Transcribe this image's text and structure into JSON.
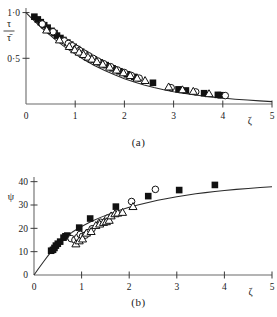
{
  "figure": {
    "panels": [
      {
        "id": "a",
        "caption": "(a)",
        "ylabel_num": "τ",
        "ylabel_den": "τ̄",
        "xlabel": "ζ"
      },
      {
        "id": "b",
        "caption": "(b)",
        "ylabel": "ψ",
        "xlabel": "ζ"
      }
    ]
  },
  "chart_data": [
    {
      "type": "scatter",
      "panel": "a",
      "title": "",
      "xlabel": "ζ",
      "ylabel": "τ/τ̄",
      "xlim": [
        0,
        5
      ],
      "ylim": [
        0,
        1.05
      ],
      "grid": false,
      "legend": "none",
      "xticks": [
        0,
        1,
        2,
        3,
        4,
        5
      ],
      "xticklabels": [
        "0",
        "1",
        "2",
        "3",
        "4",
        "5"
      ],
      "yticks": [
        0.5,
        1.0
      ],
      "yticklabels": [
        "0·5",
        "1·0"
      ],
      "curve": {
        "name": "theoretical curve",
        "x": [
          0.0,
          0.1,
          0.2,
          0.3,
          0.4,
          0.5,
          0.6,
          0.7,
          0.8,
          0.9,
          1.0,
          1.2,
          1.4,
          1.6,
          1.8,
          2.0,
          2.2,
          2.4,
          2.6,
          2.8,
          3.0,
          3.2,
          3.4,
          3.6,
          3.8,
          4.0,
          4.25,
          4.5,
          4.75,
          5.0
        ],
        "y": [
          1.0,
          0.945,
          0.892,
          0.842,
          0.793,
          0.747,
          0.702,
          0.66,
          0.62,
          0.582,
          0.546,
          0.479,
          0.419,
          0.366,
          0.319,
          0.277,
          0.24,
          0.208,
          0.18,
          0.156,
          0.135,
          0.117,
          0.101,
          0.087,
          0.075,
          0.065,
          0.053,
          0.043,
          0.034,
          0.026
        ]
      },
      "series": [
        {
          "name": "filled-square",
          "marker": "filled-square",
          "points": [
            [
              0.17,
              0.955
            ],
            [
              0.24,
              0.925
            ],
            [
              0.3,
              0.895
            ],
            [
              0.37,
              0.862
            ],
            [
              0.44,
              0.835
            ],
            [
              0.52,
              0.8
            ],
            [
              0.58,
              0.775
            ],
            [
              0.63,
              0.748
            ],
            [
              0.7,
              0.722
            ],
            [
              0.76,
              0.7
            ],
            [
              0.84,
              0.672
            ],
            [
              0.9,
              0.65
            ],
            [
              0.97,
              0.625
            ],
            [
              1.04,
              0.6
            ],
            [
              1.12,
              0.572
            ],
            [
              1.2,
              0.545
            ],
            [
              1.28,
              0.516
            ],
            [
              1.38,
              0.487
            ],
            [
              1.5,
              0.455
            ],
            [
              1.62,
              0.425
            ],
            [
              1.76,
              0.39
            ],
            [
              1.9,
              0.358
            ],
            [
              2.05,
              0.325
            ],
            [
              2.2,
              0.296
            ],
            [
              2.58,
              0.232
            ],
            [
              3.1,
              0.16
            ],
            [
              3.25,
              0.148
            ],
            [
              3.62,
              0.118
            ],
            [
              3.9,
              0.1
            ],
            [
              3.96,
              0.096
            ]
          ]
        },
        {
          "name": "open-circle",
          "marker": "open-circle",
          "points": [
            [
              0.33,
              0.875
            ],
            [
              0.55,
              0.79
            ],
            [
              0.78,
              0.69
            ],
            [
              0.86,
              0.662
            ],
            [
              0.94,
              0.636
            ],
            [
              1.02,
              0.608
            ],
            [
              1.09,
              0.585
            ],
            [
              1.18,
              0.556
            ],
            [
              1.27,
              0.528
            ],
            [
              1.36,
              0.5
            ],
            [
              1.46,
              0.47
            ],
            [
              1.58,
              0.44
            ],
            [
              1.72,
              0.408
            ],
            [
              1.86,
              0.372
            ],
            [
              2.0,
              0.344
            ],
            [
              2.14,
              0.312
            ],
            [
              2.3,
              0.283
            ],
            [
              2.95,
              0.178
            ],
            [
              3.45,
              0.132
            ],
            [
              4.05,
              0.092
            ]
          ]
        },
        {
          "name": "open-triangle",
          "marker": "open-triangle",
          "points": [
            [
              0.42,
              0.808
            ],
            [
              0.68,
              0.7
            ],
            [
              0.88,
              0.628
            ],
            [
              0.99,
              0.592
            ],
            [
              1.08,
              0.566
            ],
            [
              1.17,
              0.54
            ],
            [
              1.26,
              0.512
            ],
            [
              1.34,
              0.49
            ],
            [
              1.44,
              0.462
            ],
            [
              1.56,
              0.434
            ],
            [
              1.7,
              0.402
            ],
            [
              1.84,
              0.37
            ],
            [
              1.98,
              0.34
            ],
            [
              2.12,
              0.31
            ],
            [
              2.26,
              0.282
            ],
            [
              2.42,
              0.256
            ],
            [
              2.9,
              0.186
            ],
            [
              3.18,
              0.155
            ],
            [
              3.4,
              0.138
            ],
            [
              3.72,
              0.112
            ]
          ]
        }
      ]
    },
    {
      "type": "scatter",
      "panel": "b",
      "title": "",
      "xlabel": "ζ",
      "ylabel": "ψ",
      "xlim": [
        0,
        5
      ],
      "ylim": [
        0,
        42
      ],
      "grid": false,
      "legend": "none",
      "xticks": [
        0,
        1,
        2,
        3,
        4,
        5
      ],
      "xticklabels": [
        "0",
        "1",
        "2",
        "3",
        "4",
        "5"
      ],
      "yticks": [
        0,
        10,
        20,
        30,
        40
      ],
      "yticklabels": [
        "0",
        "10",
        "20",
        "30",
        "40"
      ],
      "curve": {
        "name": "theoretical curve",
        "x": [
          0.0,
          0.1,
          0.2,
          0.3,
          0.4,
          0.5,
          0.6,
          0.7,
          0.8,
          0.9,
          1.0,
          1.2,
          1.4,
          1.6,
          1.8,
          2.0,
          2.2,
          2.4,
          2.6,
          2.8,
          3.0,
          3.2,
          3.4,
          3.6,
          3.8,
          4.0,
          4.25,
          4.5,
          4.75,
          5.0
        ],
        "y": [
          0.0,
          2.9,
          5.7,
          8.4,
          11.0,
          13.2,
          15.1,
          16.8,
          18.3,
          19.6,
          20.8,
          22.9,
          24.7,
          26.3,
          27.7,
          29.0,
          30.1,
          31.1,
          32.0,
          32.8,
          33.5,
          34.2,
          34.8,
          35.3,
          35.8,
          36.2,
          36.7,
          37.1,
          37.5,
          37.8
        ]
      },
      "series": [
        {
          "name": "filled-square",
          "marker": "filled-square",
          "points": [
            [
              0.36,
              10.4
            ],
            [
              0.4,
              10.8
            ],
            [
              0.43,
              11.6
            ],
            [
              0.46,
              12.6
            ],
            [
              0.5,
              13.4
            ],
            [
              0.55,
              14.3
            ],
            [
              0.62,
              16.0
            ],
            [
              0.66,
              16.6
            ],
            [
              0.7,
              16.9
            ],
            [
              0.95,
              20.3
            ],
            [
              1.18,
              24.2
            ],
            [
              1.72,
              29.3
            ],
            [
              2.4,
              33.8
            ],
            [
              3.05,
              36.4
            ],
            [
              3.8,
              38.6
            ]
          ]
        },
        {
          "name": "open-circle",
          "marker": "open-circle",
          "points": [
            [
              0.78,
              15.6
            ],
            [
              0.86,
              15.0
            ],
            [
              0.92,
              16.1
            ],
            [
              0.97,
              17.4
            ],
            [
              1.02,
              16.6
            ],
            [
              1.08,
              17.1
            ],
            [
              1.14,
              18.2
            ],
            [
              1.22,
              19.8
            ],
            [
              1.4,
              22.6
            ],
            [
              1.55,
              24.4
            ],
            [
              2.05,
              31.5
            ],
            [
              2.55,
              36.7
            ]
          ]
        },
        {
          "name": "open-triangle",
          "marker": "open-triangle",
          "points": [
            [
              0.88,
              13.3
            ],
            [
              0.95,
              14.6
            ],
            [
              1.02,
              15.4
            ],
            [
              1.1,
              17.9
            ],
            [
              1.2,
              18.6
            ],
            [
              1.3,
              21.2
            ],
            [
              1.38,
              21.8
            ],
            [
              1.46,
              22.5
            ],
            [
              1.52,
              22.8
            ],
            [
              1.58,
              23.4
            ],
            [
              1.62,
              25.3
            ],
            [
              1.7,
              26.2
            ],
            [
              1.76,
              26.5
            ],
            [
              1.86,
              26.8
            ],
            [
              2.08,
              29.3
            ]
          ]
        }
      ]
    }
  ]
}
